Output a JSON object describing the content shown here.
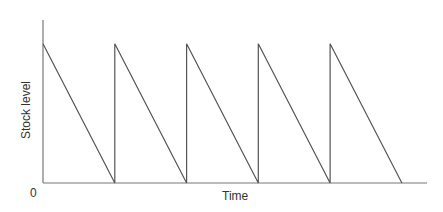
{
  "chart_data": {
    "type": "line",
    "title": "",
    "xlabel": "Time",
    "ylabel": "Stock level",
    "origin_label": "0",
    "grid": false,
    "legend": null,
    "series": [
      {
        "name": "Stock level",
        "x": [
          0,
          1,
          1,
          2,
          2,
          3,
          3,
          4,
          4,
          5
        ],
        "y": [
          1,
          0,
          1,
          0,
          1,
          0,
          1,
          0,
          1,
          0
        ]
      }
    ],
    "xlim": [
      0,
      5.35
    ],
    "ylim": [
      0,
      1.17
    ],
    "line_color": "#555555"
  }
}
